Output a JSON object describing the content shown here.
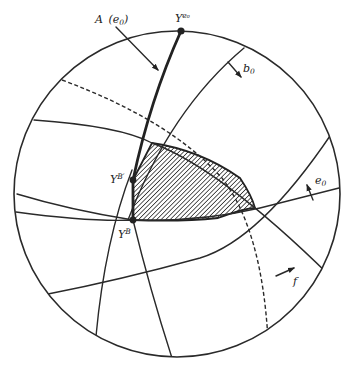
{
  "figure": {
    "labels": {
      "curve_A": {
        "main": "A",
        "arg": "(e",
        "arg_sub": "0",
        "close": ")"
      },
      "point_top": {
        "main": "Y",
        "sup": "e₀"
      },
      "point_upper": {
        "main": "Y",
        "sup": "B′"
      },
      "point_lower": {
        "main": "Y",
        "sup": "B"
      },
      "normal_b0": {
        "main": "b",
        "sub": "0"
      },
      "normal_e0": {
        "main": "e",
        "sub": "0"
      },
      "normal_f": {
        "main": "f"
      }
    },
    "colors": {
      "ink": "#222222",
      "background": "#ffffff"
    }
  }
}
